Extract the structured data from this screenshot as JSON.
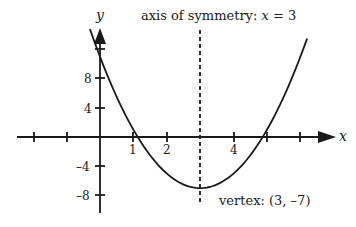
{
  "chart_data": {
    "type": "line",
    "title": "",
    "function": "y = 2(x - 3)^2 - 7",
    "xlabel": "x",
    "ylabel": "y",
    "xlim": [
      -3,
      7
    ],
    "ylim": [
      -10.5,
      14.5
    ],
    "grid": false,
    "x_ticks": [
      -2,
      -1,
      0,
      1,
      2,
      3,
      4,
      5,
      6
    ],
    "x_tick_labels": [
      {
        "value": 1,
        "label": "1"
      },
      {
        "value": 2,
        "label": "2"
      },
      {
        "value": 4,
        "label": "4"
      }
    ],
    "y_ticks": [
      -8,
      -4,
      0,
      4,
      8,
      12
    ],
    "y_tick_labels": [
      {
        "value": 8,
        "label": "8"
      },
      {
        "value": 4,
        "label": "4"
      },
      {
        "value": -4,
        "label": "–4"
      },
      {
        "value": -8,
        "label": "–8"
      }
    ],
    "series": [
      {
        "name": "parabola",
        "x": [
          -0.3,
          0,
          0.5,
          1,
          1.5,
          2,
          2.5,
          3,
          3.5,
          4,
          4.5,
          5,
          5.5,
          6,
          6.2
        ],
        "y": [
          14.78,
          11,
          5.5,
          1,
          -2.5,
          -5,
          -6.5,
          -7,
          -6.5,
          -5,
          -2.5,
          1,
          5.5,
          11,
          13.48
        ]
      }
    ],
    "axis_of_symmetry": {
      "x": 3,
      "style": "dashed"
    },
    "vertex": {
      "x": 3,
      "y": -7
    },
    "annotations": [
      {
        "text_prefix": "axis of symmetry: ",
        "text_var": "x",
        "text_suffix": " = 3"
      },
      {
        "text": "vertex:  (3, –7)"
      }
    ]
  },
  "labels": {
    "y_axis": "y",
    "x_axis": "x",
    "axis_sym_prefix": "axis of symmetry: ",
    "axis_sym_var": "x",
    "axis_sym_suffix": " = 3",
    "vertex": "vertex:  (3, –7)",
    "xt1": "1",
    "xt2": "2",
    "xt4": "4",
    "yt8": "8",
    "yt4": "4",
    "ytm4": "–4",
    "ytm8": "–8"
  },
  "colors": {
    "ink": "#1a1a1a",
    "background": "#ffffff"
  }
}
